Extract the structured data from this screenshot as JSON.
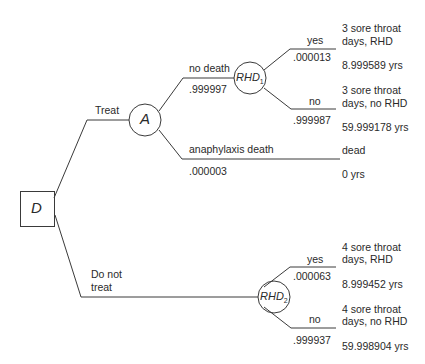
{
  "nodes": {
    "decision": {
      "label": "D"
    },
    "chance_a": {
      "label": "A"
    },
    "chance_rhd1": {
      "label": "RHD",
      "sub": "1"
    },
    "chance_rhd2": {
      "label": "RHD",
      "sub": "2"
    }
  },
  "branches": {
    "treat": {
      "label": "Treat"
    },
    "do_not_treat": {
      "label_line1": "Do not",
      "label_line2": "treat"
    },
    "no_death": {
      "label": "no death",
      "prob": ".999997"
    },
    "anaphylaxis_death": {
      "label": "anaphylaxis death",
      "prob": ".000003"
    },
    "rhd1_yes": {
      "label": "yes",
      "prob": ".000013"
    },
    "rhd1_no": {
      "label": "no",
      "prob": ".999987"
    },
    "rhd2_yes": {
      "label": "yes",
      "prob": ".000063"
    },
    "rhd2_no": {
      "label": "no",
      "prob": ".999937"
    }
  },
  "outcomes": {
    "treat_rhd": {
      "line1": "3 sore throat",
      "line2": "days, RHD",
      "value": "8.999589 yrs"
    },
    "treat_no_rhd": {
      "line1": "3 sore throat",
      "line2": "days, no RHD",
      "value": "59.999178 yrs"
    },
    "dead": {
      "line1": "dead",
      "value": "0 yrs"
    },
    "notreat_rhd": {
      "line1": "4 sore throat",
      "line2": "days, RHD",
      "value": "8.999452 yrs"
    },
    "notreat_no_rhd": {
      "line1": "4 sore throat",
      "line2": "days, no RHD",
      "value": "59.998904 yrs"
    }
  }
}
